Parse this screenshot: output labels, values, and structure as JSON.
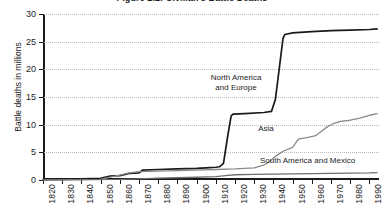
{
  "chart_data": {
    "type": "line",
    "title": "Figure 2.2: Civilian's Battle Deaths",
    "xlabel": "",
    "ylabel": "Battle deaths in millions",
    "xlim": [
      1820,
      1995
    ],
    "ylim": [
      0,
      30
    ],
    "grid": true,
    "legend_position": "inline-annotations",
    "xticks": [
      "1820",
      "1830",
      "1840",
      "1850",
      "1860",
      "1870",
      "1880",
      "1890",
      "1900",
      "1910",
      "1920",
      "1930",
      "1940",
      "1950",
      "1960",
      "1970",
      "1980",
      "1990"
    ],
    "yticks": [
      "0",
      "5",
      "10",
      "15",
      "20",
      "25",
      "30"
    ],
    "series": [
      {
        "name": "North America and Europe",
        "color": "#1a1a1a",
        "x": [
          1820,
          1830,
          1840,
          1850,
          1855,
          1860,
          1865,
          1870,
          1872,
          1880,
          1890,
          1900,
          1905,
          1910,
          1912,
          1914,
          1916,
          1918,
          1919,
          1925,
          1935,
          1939,
          1941,
          1943,
          1945,
          1946,
          1950,
          1960,
          1970,
          1980,
          1990,
          1994
        ],
        "y": [
          0.05,
          0.1,
          0.2,
          0.3,
          0.7,
          0.8,
          1.2,
          1.3,
          1.8,
          1.9,
          2.0,
          2.1,
          2.2,
          2.3,
          2.4,
          3.0,
          7.5,
          11.6,
          11.9,
          12.0,
          12.2,
          12.4,
          14.5,
          20.0,
          25.6,
          26.3,
          26.6,
          26.8,
          27.0,
          27.1,
          27.2,
          27.3
        ]
      },
      {
        "name": "Asia",
        "color": "#8a8a8a",
        "x": [
          1820,
          1840,
          1850,
          1855,
          1860,
          1865,
          1870,
          1880,
          1890,
          1900,
          1910,
          1920,
          1930,
          1935,
          1938,
          1940,
          1945,
          1950,
          1953,
          1958,
          1962,
          1965,
          1968,
          1972,
          1975,
          1980,
          1985,
          1990,
          1994
        ],
        "y": [
          0.02,
          0.05,
          0.1,
          0.5,
          0.9,
          1.3,
          1.5,
          1.6,
          1.7,
          1.8,
          1.9,
          2.0,
          2.2,
          2.7,
          3.3,
          4.0,
          5.2,
          5.9,
          7.4,
          7.7,
          8.0,
          8.8,
          9.6,
          10.3,
          10.6,
          10.8,
          11.2,
          11.7,
          12.0
        ]
      },
      {
        "name": "South America and Mexico",
        "color": "#6e6e6e",
        "x": [
          1820,
          1840,
          1860,
          1870,
          1880,
          1900,
          1910,
          1915,
          1920,
          1930,
          1940,
          1950,
          1960,
          1970,
          1980,
          1990,
          1994
        ],
        "y": [
          0.02,
          0.05,
          0.1,
          0.2,
          0.35,
          0.5,
          0.6,
          0.8,
          0.95,
          1.0,
          1.05,
          1.1,
          1.15,
          1.2,
          1.25,
          1.3,
          1.35
        ]
      }
    ],
    "annotations": [
      {
        "text": "North America and Europe",
        "line1": "North America",
        "line2": "and Europe"
      },
      {
        "text": "Asia"
      },
      {
        "text": "South America and Mexico"
      }
    ]
  },
  "labels": {
    "title": "Figure 2.2: Civilian's Battle Deaths",
    "y_axis_title": "Battle deaths in millions",
    "ann_north_america_line1": "North America",
    "ann_north_america_line2": "and Europe",
    "ann_asia": "Asia",
    "ann_south_america": "South America and Mexico"
  }
}
